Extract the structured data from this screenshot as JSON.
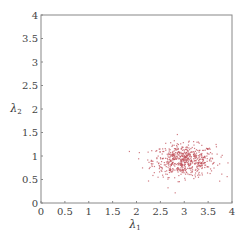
{
  "chart_data": {
    "type": "scatter",
    "title": "",
    "xlabel": "λ1",
    "ylabel": "λ2",
    "xlim": [
      0,
      4
    ],
    "ylim": [
      0,
      4
    ],
    "xticks": [
      0,
      0.5,
      1,
      1.5,
      2,
      2.5,
      3,
      3.5,
      4
    ],
    "xtick_labels": [
      "0",
      "0.5",
      "1",
      "1.5",
      "2",
      "2.5",
      "3",
      "3.5",
      "4"
    ],
    "yticks": [
      0,
      0.5,
      1,
      1.5,
      2,
      2.5,
      3,
      3.5,
      4
    ],
    "ytick_labels": [
      "0",
      "0.5",
      "1",
      "1.5",
      "2",
      "2.5",
      "3",
      "3.5",
      "4"
    ],
    "grid": false,
    "legend": null,
    "series": [
      {
        "name": "samples",
        "color": "#c0505a",
        "marker_size": 1.2,
        "count": 600,
        "distribution": "gaussian",
        "center": [
          3.0,
          0.9
        ],
        "std": [
          0.33,
          0.17
        ],
        "x_range_approx": [
          2.3,
          4.0
        ],
        "y_range_approx": [
          0.5,
          1.5
        ]
      }
    ]
  },
  "labels": {
    "xlabel_main": "λ",
    "xlabel_sub": "1",
    "ylabel_main": "λ",
    "ylabel_sub": "2"
  },
  "colors": {
    "axis": "#888888",
    "points": "#c0505a"
  }
}
